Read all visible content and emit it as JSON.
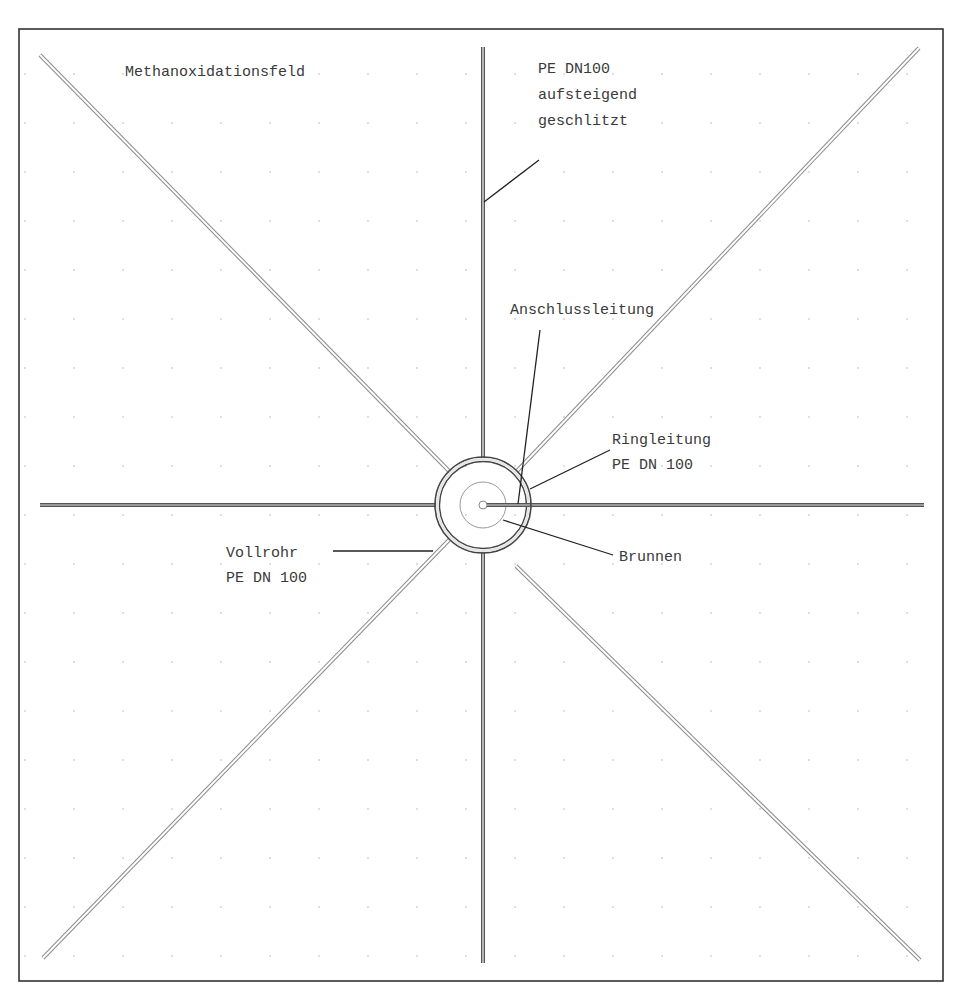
{
  "diagram": {
    "type": "plan-view pipe layout",
    "frame": {
      "x": 19,
      "y": 29,
      "w": 924,
      "h": 952,
      "stroke": "#333333"
    },
    "center": {
      "x": 483,
      "y": 505
    },
    "grid_dot_color": "#c8c8c8",
    "labels": {
      "field": "Methanoxidationsfeld",
      "riser_line1": "PE DN100",
      "riser_line2": "aufsteigend",
      "riser_line3": "geschlitzt",
      "connection": "Anschlussleitung",
      "ring_line1": "Ringleitung",
      "ring_line2": "PE DN 100",
      "well": "Brunnen",
      "solid_line1": "Vollrohr",
      "solid_line2": "PE DN 100"
    },
    "pipes": [
      {
        "name": "north",
        "x1": 483,
        "y1": 47,
        "x2": 483,
        "y2": 458
      },
      {
        "name": "south",
        "x1": 483,
        "y1": 552,
        "x2": 483,
        "y2": 963
      },
      {
        "name": "west",
        "x1": 40,
        "y1": 505,
        "x2": 436,
        "y2": 505
      },
      {
        "name": "east",
        "x1": 530,
        "y1": 505,
        "x2": 924,
        "y2": 505
      },
      {
        "name": "northwest",
        "x1": 40,
        "y1": 55,
        "x2": 450,
        "y2": 472
      },
      {
        "name": "northeast",
        "x1": 919,
        "y1": 48,
        "x2": 517,
        "y2": 471
      },
      {
        "name": "southeast",
        "x1": 920,
        "y1": 960,
        "x2": 516,
        "y2": 566
      },
      {
        "name": "southwest",
        "x1": 43,
        "y1": 958,
        "x2": 449,
        "y2": 540
      }
    ],
    "ring": {
      "r_outer": 47,
      "r_inner": 44
    },
    "well": {
      "r_shaft": 23,
      "r_core": 4
    }
  }
}
